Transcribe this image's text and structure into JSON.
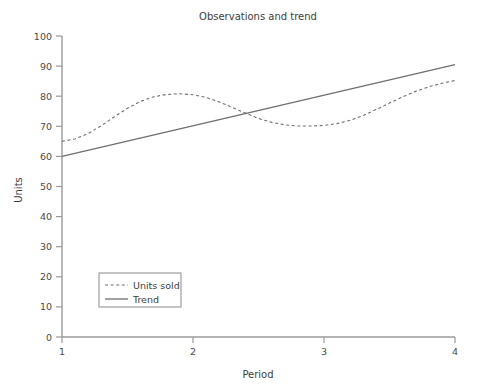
{
  "chart_data": {
    "type": "line",
    "title": "Observations and trend",
    "xlabel": "Period",
    "ylabel": "Units",
    "xlim": [
      1,
      4
    ],
    "ylim": [
      0,
      100
    ],
    "xticks": [
      "1",
      "2",
      "3",
      "4"
    ],
    "yticks": [
      "0",
      "10",
      "20",
      "30",
      "40",
      "50",
      "60",
      "70",
      "80",
      "90",
      "100"
    ],
    "grid": false,
    "legend_position": "lower left",
    "series": [
      {
        "name": "Units sold",
        "style": "dashed",
        "color": "#6f6f6f",
        "x": [
          1.0,
          1.1,
          1.2,
          1.3,
          1.4,
          1.5,
          1.6,
          1.7,
          1.8,
          1.9,
          2.0,
          2.1,
          2.2,
          2.3,
          2.4,
          2.5,
          2.6,
          2.7,
          2.8,
          2.9,
          3.0,
          3.1,
          3.2,
          3.3,
          3.4,
          3.5,
          3.6,
          3.7,
          3.8,
          3.9,
          4.0
        ],
        "values": [
          65.0,
          65.8,
          67.6,
          70.2,
          73.2,
          76.0,
          78.3,
          79.8,
          80.6,
          80.8,
          80.5,
          79.6,
          78.1,
          76.3,
          74.4,
          72.6,
          71.3,
          70.5,
          70.1,
          70.1,
          70.3,
          70.9,
          72.0,
          73.6,
          75.6,
          77.7,
          79.8,
          81.6,
          83.1,
          84.3,
          85.2
        ]
      },
      {
        "name": "Trend",
        "style": "solid",
        "color": "#6f6f6f",
        "x": [
          1,
          4
        ],
        "values": [
          60.0,
          90.5
        ]
      }
    ],
    "annotations": []
  },
  "legend": {
    "items": [
      {
        "label": "Units sold",
        "style": "dashed"
      },
      {
        "label": "Trend",
        "style": "solid"
      }
    ]
  }
}
